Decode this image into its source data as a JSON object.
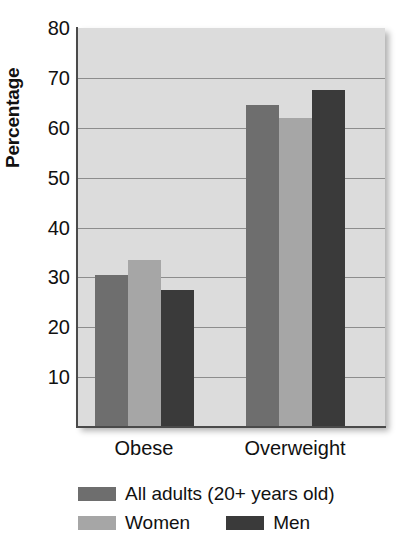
{
  "chart_data": {
    "type": "bar",
    "title": "",
    "subtitle": "",
    "xlabel": "",
    "ylabel": "Percentage",
    "categories": [
      "Obese",
      "Overweight"
    ],
    "series": [
      {
        "name": "All adults (20+ years old)",
        "values": [
          30.5,
          64.5
        ],
        "color": "#6e6e6e"
      },
      {
        "name": "Women",
        "values": [
          33.5,
          62.0
        ],
        "color": "#a6a6a6"
      },
      {
        "name": "Men",
        "values": [
          27.5,
          67.5
        ],
        "color": "#3a3a3a"
      }
    ],
    "ylim": [
      0,
      80
    ],
    "y_ticks": [
      10,
      20,
      30,
      40,
      50,
      60,
      70,
      80
    ],
    "y_tick_labels": [
      "10",
      "20",
      "30",
      "40",
      "50",
      "60",
      "70",
      "80"
    ],
    "grid": true,
    "legend_position": "below",
    "plot_background": "#dcdcdc",
    "gridline_color": "#8d8d8d",
    "axis_color": "#4a4a4a"
  },
  "legend": {
    "entries": [
      {
        "label": "All adults (20+ years old)",
        "color": "#6e6e6e"
      },
      {
        "label": "Women",
        "color": "#a6a6a6"
      },
      {
        "label": "Men",
        "color": "#3a3a3a"
      }
    ]
  }
}
